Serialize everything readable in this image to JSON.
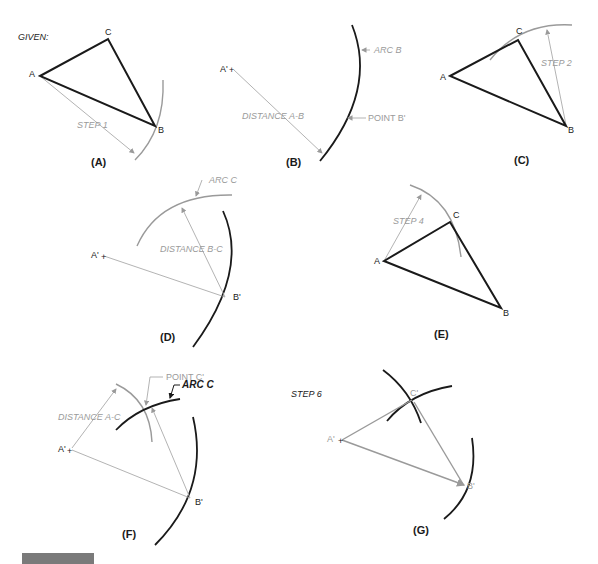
{
  "figure": {
    "given_label": "GIVEN:",
    "footer_text": "",
    "colors": {
      "primary_line": "#1a1a1a",
      "construction_line": "#9a9a9a",
      "background": "#ffffff",
      "footer_bar": "#7a7a7a"
    }
  },
  "panels": {
    "A": {
      "caption": "(A)",
      "vertex_a": "A",
      "vertex_b": "B",
      "vertex_c": "C",
      "step": "STEP 1"
    },
    "B": {
      "caption": "(B)",
      "point_a": "A'",
      "arc": "ARC B",
      "point_b": "POINT B'",
      "distance": "DISTANCE A-B"
    },
    "C": {
      "caption": "(C)",
      "vertex_a": "A",
      "vertex_b": "B",
      "vertex_c": "C",
      "step": "STEP 2"
    },
    "D": {
      "caption": "(D)",
      "point_a": "A'",
      "point_b": "B'",
      "arc": "ARC C",
      "distance": "DISTANCE B-C"
    },
    "E": {
      "caption": "(E)",
      "vertex_a": "A",
      "vertex_b": "B",
      "vertex_c": "C",
      "step": "STEP 4"
    },
    "F": {
      "caption": "(F)",
      "point_a": "A'",
      "point_b": "B'",
      "point_c": "POINT C'",
      "arc": "ARC C",
      "distance": "DISTANCE A-C"
    },
    "G": {
      "caption": "(G)",
      "step": "STEP 6",
      "point_a": "A'",
      "point_b": "B'",
      "point_c": "C'"
    }
  }
}
